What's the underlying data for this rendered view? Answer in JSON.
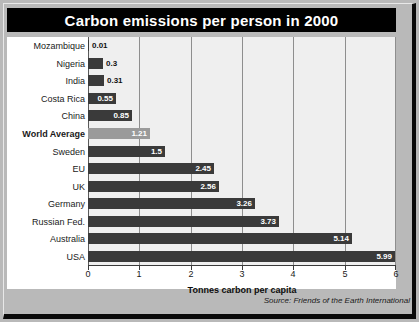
{
  "title": "Carbon emissions per person in 2000",
  "axis_title": "Tonnes carbon per capita",
  "source": "Source: Friends of the Earth International",
  "colors": {
    "banner_bg": "#000000",
    "banner_text": "#ffffff",
    "bar": "#3a3a3a",
    "bar_highlight": "#9a9a9a",
    "plot_bg": "#efefef",
    "gridline": "#8e8e8e",
    "page_bg": "#b9b9b9"
  },
  "chart_data": {
    "type": "bar",
    "orientation": "horizontal",
    "title": "Carbon emissions per person in 2000",
    "xlabel": "Tonnes carbon per capita",
    "ylabel": "",
    "xlim": [
      0,
      6
    ],
    "xticks": [
      0,
      1,
      2,
      3,
      4,
      5,
      6
    ],
    "xticklabels": [
      "0",
      "1",
      "2",
      "3",
      "4",
      "5",
      "6"
    ],
    "grid": true,
    "legend": false,
    "annotation": "Source: Friends of the Earth International",
    "categories": [
      "Mozambique",
      "Nigeria",
      "India",
      "Costa Rica",
      "China",
      "World Average",
      "Sweden",
      "EU",
      "UK",
      "Germany",
      "Russian Fed.",
      "Australia",
      "USA"
    ],
    "values": [
      0.01,
      0.3,
      0.31,
      0.55,
      0.85,
      1.21,
      1.5,
      2.45,
      2.56,
      3.26,
      3.73,
      5.14,
      5.99
    ],
    "value_labels": [
      "0.01",
      "0.3",
      "0.31",
      "0.55",
      "0.85",
      "1.21",
      "1.5",
      "2.45",
      "2.56",
      "3.26",
      "3.73",
      "5.14",
      "5.99"
    ],
    "highlight_category": "World Average"
  }
}
